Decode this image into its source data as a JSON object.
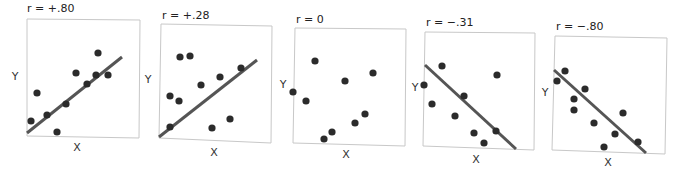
{
  "figure": {
    "axis_x_label": "X",
    "axis_y_label": "Y",
    "colors": {
      "box": "#c8c8c8",
      "line": "#555555",
      "dot": "#2b2b2b",
      "text": "#222222"
    }
  },
  "chart_data": [
    {
      "type": "scatter",
      "title": "r = +.80",
      "xlabel": "X",
      "ylabel": "Y",
      "grid": false,
      "has_trend_line": true,
      "trend": "positive",
      "points": [
        [
          31,
          121
        ],
        [
          37,
          93
        ],
        [
          47,
          115
        ],
        [
          57,
          132
        ],
        [
          66,
          104
        ],
        [
          76,
          73
        ],
        [
          87,
          84
        ],
        [
          96,
          75
        ],
        [
          98,
          53
        ],
        [
          108,
          75
        ]
      ],
      "line": [
        [
          27,
          133
        ],
        [
          122,
          57
        ]
      ],
      "box": [
        [
          27,
          19
        ],
        [
          140,
          20
        ],
        [
          139,
          138
        ],
        [
          27,
          136
        ]
      ],
      "title_pos": [
        27,
        12
      ],
      "ylabel_pos": [
        15,
        80
      ],
      "xlabel_pos": [
        77,
        151
      ]
    },
    {
      "type": "scatter",
      "title": "r = +.28",
      "xlabel": "X",
      "ylabel": "Y",
      "grid": false,
      "has_trend_line": true,
      "trend": "positive",
      "points": [
        [
          170,
          127
        ],
        [
          170,
          96
        ],
        [
          179,
          101
        ],
        [
          180,
          57
        ],
        [
          190,
          56
        ],
        [
          201,
          85
        ],
        [
          212,
          128
        ],
        [
          220,
          77
        ],
        [
          230,
          119
        ],
        [
          241,
          68
        ]
      ],
      "line": [
        [
          159,
          137
        ],
        [
          257,
          60
        ]
      ],
      "box": [
        [
          161,
          24
        ],
        [
          272,
          26
        ],
        [
          271,
          143
        ],
        [
          159,
          138
        ]
      ],
      "title_pos": [
        162,
        19
      ],
      "ylabel_pos": [
        148,
        83
      ],
      "xlabel_pos": [
        214,
        156
      ]
    },
    {
      "type": "scatter",
      "title": "r = 0",
      "xlabel": "X",
      "ylabel": "Y",
      "grid": false,
      "has_trend_line": false,
      "trend": "none",
      "points": [
        [
          293,
          92
        ],
        [
          306,
          101
        ],
        [
          315,
          61
        ],
        [
          324,
          139
        ],
        [
          332,
          132
        ],
        [
          345,
          81
        ],
        [
          355,
          123
        ],
        [
          365,
          114
        ],
        [
          373,
          73
        ]
      ],
      "line": null,
      "box": [
        [
          295,
          28
        ],
        [
          406,
          29
        ],
        [
          405,
          146
        ],
        [
          293,
          143
        ]
      ],
      "title_pos": [
        296,
        23
      ],
      "ylabel_pos": [
        283,
        88
      ],
      "xlabel_pos": [
        346,
        158
      ]
    },
    {
      "type": "scatter",
      "title": "r = −.31",
      "xlabel": "X",
      "ylabel": "Y",
      "grid": false,
      "has_trend_line": true,
      "trend": "negative",
      "points": [
        [
          424,
          85
        ],
        [
          432,
          104
        ],
        [
          442,
          66
        ],
        [
          455,
          116
        ],
        [
          464,
          96
        ],
        [
          474,
          133
        ],
        [
          484,
          143
        ],
        [
          496,
          131
        ],
        [
          497,
          75
        ]
      ],
      "line": [
        [
          425,
          65
        ],
        [
          516,
          149
        ]
      ],
      "box": [
        [
          425,
          32
        ],
        [
          535,
          33
        ],
        [
          534,
          150
        ],
        [
          423,
          146
        ]
      ],
      "title_pos": [
        426,
        26
      ],
      "ylabel_pos": [
        415,
        91
      ],
      "xlabel_pos": [
        476,
        163
      ]
    },
    {
      "type": "scatter",
      "title": "r = −.80",
      "xlabel": "X",
      "ylabel": "Y",
      "grid": false,
      "has_trend_line": true,
      "trend": "negative",
      "points": [
        [
          557,
          81
        ],
        [
          565,
          71
        ],
        [
          574,
          99
        ],
        [
          574,
          110
        ],
        [
          585,
          89
        ],
        [
          594,
          123
        ],
        [
          604,
          147
        ],
        [
          615,
          134
        ],
        [
          623,
          113
        ],
        [
          638,
          142
        ]
      ],
      "line": [
        [
          554,
          70
        ],
        [
          646,
          153
        ]
      ],
      "box": [
        [
          555,
          36
        ],
        [
          667,
          38
        ],
        [
          665,
          154
        ],
        [
          552,
          150
        ]
      ],
      "title_pos": [
        556,
        30
      ],
      "ylabel_pos": [
        545,
        96
      ],
      "xlabel_pos": [
        608,
        166
      ]
    }
  ]
}
